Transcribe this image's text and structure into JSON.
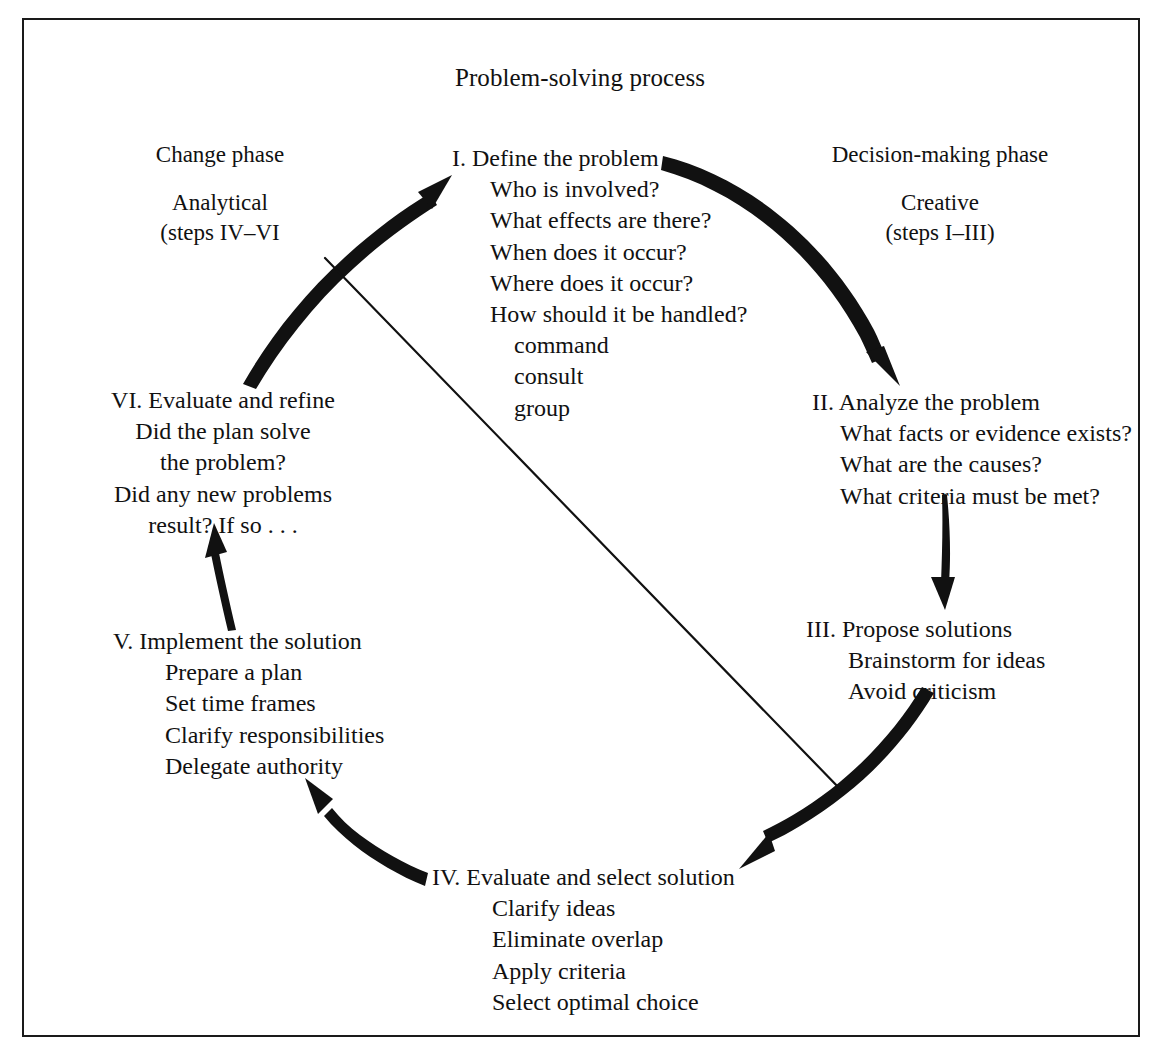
{
  "title": "Problem-solving process",
  "phases": {
    "left": {
      "name": "Change phase",
      "kind": "Analytical",
      "steps_range": "(steps IV–VI"
    },
    "right": {
      "name": "Decision-making phase",
      "kind": "Creative",
      "steps_range": "(steps I–III)"
    }
  },
  "steps": {
    "one": {
      "head": "I. Define the problem",
      "items": [
        "Who is involved?",
        "What effects are there?",
        "When does it occur?",
        "Where does it occur?",
        "How should it be handled?"
      ],
      "subitems": [
        "command",
        "consult",
        "group"
      ]
    },
    "two": {
      "head": "II. Analyze the problem",
      "items": [
        "What facts or evidence exists?",
        "What are the causes?",
        "What criteria must be met?"
      ]
    },
    "three": {
      "head": "III. Propose solutions",
      "items": [
        "Brainstorm for ideas",
        "Avoid criticism"
      ]
    },
    "four": {
      "head": "IV. Evaluate and select solution",
      "items": [
        "Clarify ideas",
        "Eliminate overlap",
        "Apply criteria",
        "Select optimal choice"
      ]
    },
    "five": {
      "head": "V. Implement the solution",
      "items": [
        "Prepare a plan",
        "Set time frames",
        "Clarify responsibilities",
        "Delegate authority"
      ]
    },
    "six": {
      "head": "VI. Evaluate and refine",
      "items": [
        "Did the plan solve",
        "the problem?",
        "Did any new problems",
        "result? If so . . ."
      ]
    }
  },
  "colors": {
    "ink": "#111111",
    "frame": "#1a1a1a",
    "background": "#ffffff"
  }
}
